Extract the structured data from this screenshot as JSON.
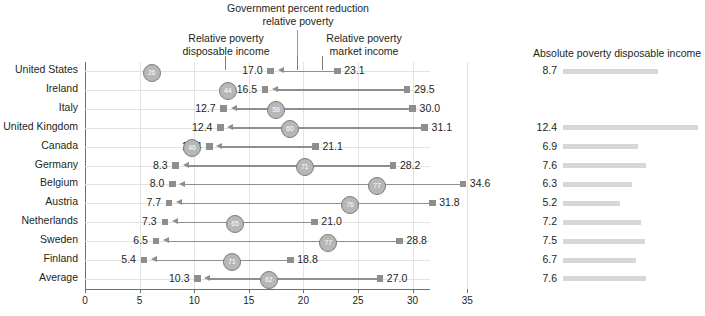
{
  "header": {
    "title": "Government percent reduction\nrelative poverty",
    "title_line1": "Government percent reduction",
    "title_line2": "relative poverty",
    "left_label_line1": "Relative poverty",
    "left_label_line2": "disposable income",
    "right_label_line1": "Relative poverty",
    "right_label_line2": "market income",
    "absolute_panel_title": "Absolute poverty disposable income"
  },
  "colors": {
    "marker": "#8e8e8e",
    "circle_fill": "#b7b7b7",
    "circle_stroke": "#7c7c7c",
    "bar": "#d7d7d7",
    "grid": "#e3e3e3",
    "axis": "#6e6e6e",
    "text": "#231f20"
  },
  "chart_data": {
    "type": "bar",
    "title": "Government percent reduction relative poverty",
    "subtitle": "Relative poverty disposable income vs Relative poverty market income",
    "xlabel": "",
    "ylabel": "",
    "xlim": [
      0,
      36.5
    ],
    "grid": true,
    "legend": "none",
    "xticks": [
      0,
      5,
      10,
      15,
      20,
      25,
      30,
      35
    ],
    "xticklabels": [
      "0",
      "5",
      "10",
      "15",
      "20",
      "25",
      "30",
      "35"
    ],
    "categories": [
      "United States",
      "Ireland",
      "Italy",
      "United Kingdom",
      "Canada",
      "Germany",
      "Belgium",
      "Austria",
      "Netherlands",
      "Sweden",
      "Finland",
      "Average"
    ],
    "series": [
      {
        "name": "Relative poverty disposable income",
        "values": [
          17.0,
          16.5,
          12.7,
          12.4,
          11.4,
          8.3,
          8.0,
          7.7,
          7.3,
          6.5,
          5.4,
          10.3
        ]
      },
      {
        "name": "Relative poverty market income",
        "values": [
          23.1,
          29.5,
          30.0,
          31.1,
          21.1,
          28.2,
          34.6,
          31.8,
          21.0,
          28.8,
          18.8,
          27.0
        ]
      },
      {
        "name": "Government percent reduction relative poverty",
        "values": [
          26,
          44,
          58,
          60,
          46,
          71,
          77,
          76,
          65,
          77,
          71,
          62
        ]
      },
      {
        "name": "Absolute poverty disposable income",
        "values": [
          8.7,
          null,
          null,
          12.4,
          6.9,
          7.6,
          6.3,
          5.2,
          7.2,
          7.5,
          6.7,
          7.6
        ]
      }
    ]
  },
  "rows": [
    {
      "label": "United States",
      "disposable": "17.0",
      "market": "23.1",
      "reduction": "26",
      "absolute": "8.7"
    },
    {
      "label": "Ireland",
      "disposable": "16.5",
      "market": "29.5",
      "reduction": "44",
      "absolute": ""
    },
    {
      "label": "Italy",
      "disposable": "12.7",
      "market": "30.0",
      "reduction": "58",
      "absolute": ""
    },
    {
      "label": "United Kingdom",
      "disposable": "12.4",
      "market": "31.1",
      "reduction": "60",
      "absolute": "12.4"
    },
    {
      "label": "Canada",
      "disposable": "11.4",
      "market": "21.1",
      "reduction": "46",
      "absolute": "6.9"
    },
    {
      "label": "Germany",
      "disposable": "8.3",
      "market": "28.2",
      "reduction": "71",
      "absolute": "7.6"
    },
    {
      "label": "Belgium",
      "disposable": "8.0",
      "market": "34.6",
      "reduction": "77",
      "absolute": "6.3"
    },
    {
      "label": "Austria",
      "disposable": "7.7",
      "market": "31.8",
      "reduction": "76",
      "absolute": "5.2"
    },
    {
      "label": "Netherlands",
      "disposable": "7.3",
      "market": "21.0",
      "reduction": "65",
      "absolute": "7.2"
    },
    {
      "label": "Sweden",
      "disposable": "6.5",
      "market": "28.8",
      "reduction": "77",
      "absolute": "7.5"
    },
    {
      "label": "Finland",
      "disposable": "5.4",
      "market": "18.8",
      "reduction": "71",
      "absolute": "6.7"
    },
    {
      "label": "Average",
      "disposable": "10.3",
      "market": "27.0",
      "reduction": "62",
      "absolute": "7.6"
    }
  ],
  "axis": {
    "ticks": [
      "0",
      "5",
      "10",
      "15",
      "20",
      "25",
      "30",
      "35"
    ]
  }
}
